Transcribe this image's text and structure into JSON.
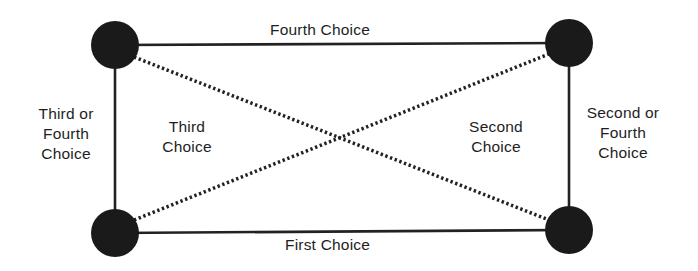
{
  "diagram": {
    "nodes": [
      {
        "id": "top-left",
        "cx": 115,
        "cy": 45
      },
      {
        "id": "top-right",
        "cx": 569,
        "cy": 43
      },
      {
        "id": "bottom-left",
        "cx": 115,
        "cy": 233
      },
      {
        "id": "bottom-right",
        "cx": 569,
        "cy": 230
      }
    ],
    "node_radius": 24,
    "node_color": "#1a1a1a",
    "edges": [
      {
        "from": "top-left",
        "to": "top-right",
        "style": "solid",
        "label": "Fourth Choice"
      },
      {
        "from": "bottom-left",
        "to": "bottom-right",
        "style": "solid",
        "label": "First Choice"
      },
      {
        "from": "top-left",
        "to": "bottom-left",
        "style": "solid",
        "label": "Third or Fourth Choice"
      },
      {
        "from": "top-right",
        "to": "bottom-right",
        "style": "solid",
        "label": "Second or Fourth Choice"
      },
      {
        "from": "top-left",
        "to": "bottom-right",
        "style": "dotted",
        "label": "Second Choice"
      },
      {
        "from": "bottom-left",
        "to": "top-right",
        "style": "dotted",
        "label": "Third Choice"
      }
    ],
    "labels": {
      "top": "Fourth Choice",
      "bottom": "First Choice",
      "left_line1": "Third or",
      "left_line2": "Fourth",
      "left_line3": "Choice",
      "right_line1": "Second or",
      "right_line2": "Fourth",
      "right_line3": "Choice",
      "inner_left_line1": "Third",
      "inner_left_line2": "Choice",
      "inner_right_line1": "Second",
      "inner_right_line2": "Choice"
    }
  }
}
